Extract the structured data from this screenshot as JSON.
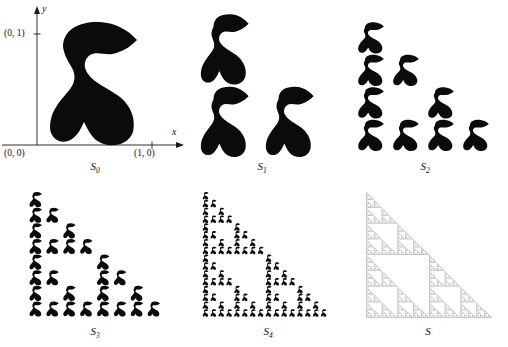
{
  "figure": {
    "background_color": "#ffffff",
    "ink_color": "#0b0b0b",
    "limit_color": "#8a8a8a",
    "width": 508,
    "height": 347
  },
  "axes": {
    "origin_label": "(0, 0)",
    "y_unit_label": "(0, 1)",
    "x_unit_label": "(1, 0)",
    "x_axis_name": "x",
    "y_axis_name": "y"
  },
  "panels": [
    {
      "id": "s0",
      "caption": "S",
      "caption_sub": "0",
      "copies": 1,
      "depth": 0,
      "rows": 1,
      "has_axes": true,
      "description": "Single S-shaped blob in the unit square"
    },
    {
      "id": "s1",
      "caption": "S",
      "caption_sub": "1",
      "copies": 3,
      "depth": 1,
      "rows": 2,
      "has_axes": false,
      "description": "Three half-scale copies of the seed blob"
    },
    {
      "id": "s2",
      "caption": "S",
      "caption_sub": "2",
      "copies": 9,
      "depth": 2,
      "rows": 4,
      "has_axes": false,
      "description": "Nine quarter-scale copies of the seed blob"
    },
    {
      "id": "s3",
      "caption": "S",
      "caption_sub": "3",
      "copies": 27,
      "depth": 3,
      "rows": 8,
      "has_axes": false,
      "description": "Twenty-seven eighth-scale copies of the seed blob"
    },
    {
      "id": "s4",
      "caption": "S",
      "caption_sub": "4",
      "copies": 81,
      "depth": 4,
      "rows": 16,
      "has_axes": false,
      "description": "Eighty-one sixteenth-scale copies of the seed blob"
    },
    {
      "id": "s",
      "caption": "S",
      "caption_sub": "",
      "copies": 0,
      "depth": 7,
      "rows": 128,
      "has_axes": false,
      "description": "Limiting attractor, the Sierpinski gasket"
    }
  ],
  "chart_data": {
    "type": "diagram",
    "seed_shape": "S-shaped blob",
    "contraction_ratio": 0.5,
    "maps": 3,
    "map_offsets": [
      [
        0,
        0.5
      ],
      [
        0,
        0
      ],
      [
        0.5,
        0
      ]
    ],
    "copy_counts": [
      1,
      3,
      9,
      27,
      81
    ],
    "labels": [
      "S0",
      "S1",
      "S2",
      "S3",
      "S4",
      "S"
    ],
    "fractal_dimension": 1.585,
    "unit_square": [
      [
        0,
        0
      ],
      [
        1,
        0
      ],
      [
        0,
        1
      ],
      [
        1,
        1
      ]
    ]
  }
}
